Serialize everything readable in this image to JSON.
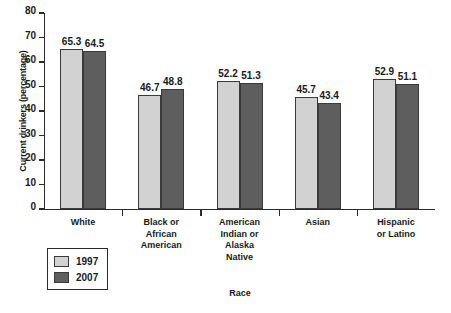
{
  "chart_data": {
    "type": "bar",
    "title": "",
    "xlabel": "Race",
    "ylabel": "Current drinkers (percentage)",
    "ylim": [
      0,
      80
    ],
    "yticks": [
      0,
      10,
      20,
      30,
      40,
      50,
      60,
      70,
      80
    ],
    "grid": false,
    "legend_position": "bottom-left",
    "categories": [
      "White",
      "Black or African American",
      "American Indian or Alaska Native",
      "Asian",
      "Hispanic or Latino"
    ],
    "category_lines": [
      [
        "White"
      ],
      [
        "Black or",
        "African",
        "American"
      ],
      [
        "American",
        "Indian or",
        "Alaska",
        "Native"
      ],
      [
        "Asian"
      ],
      [
        "Hispanic",
        "or Latino"
      ]
    ],
    "series": [
      {
        "name": "1997",
        "color": "#d2d2d2",
        "values": [
          65.3,
          46.7,
          52.2,
          45.7,
          52.9
        ]
      },
      {
        "name": "2007",
        "color": "#5e5e5e",
        "values": [
          64.5,
          48.8,
          51.3,
          43.4,
          51.1
        ]
      }
    ]
  },
  "legend": {
    "items": [
      {
        "label": "1997"
      },
      {
        "label": "2007"
      }
    ]
  }
}
